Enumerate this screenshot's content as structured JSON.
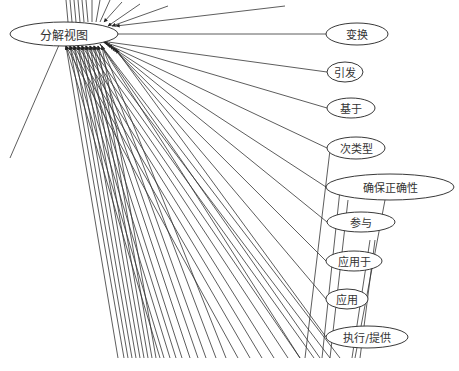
{
  "diagram": {
    "title": "",
    "hub": {
      "label": "分解视图",
      "cx": 64,
      "cy": 34,
      "rx": 54,
      "ry": 12
    },
    "nodes": [
      {
        "id": "bianhuan",
        "label": "变换",
        "cx": 357,
        "cy": 34,
        "rx": 31,
        "ry": 11
      },
      {
        "id": "yinfa",
        "label": "引发",
        "cx": 345,
        "cy": 72,
        "rx": 18,
        "ry": 10
      },
      {
        "id": "jiyu",
        "label": "基于",
        "cx": 351,
        "cy": 108,
        "rx": 24,
        "ry": 10
      },
      {
        "id": "cileixing",
        "label": "次类型",
        "cx": 356,
        "cy": 148,
        "rx": 29,
        "ry": 11
      },
      {
        "id": "quebao",
        "label": "确保正确性",
        "cx": 390,
        "cy": 187,
        "rx": 64,
        "ry": 13
      },
      {
        "id": "canyu",
        "label": "参与",
        "cx": 361,
        "cy": 222,
        "rx": 34,
        "ry": 10
      },
      {
        "id": "yingyongyu",
        "label": "应用于",
        "cx": 354,
        "cy": 261,
        "rx": 28,
        "ry": 10
      },
      {
        "id": "yingyong",
        "label": "应用",
        "cx": 347,
        "cy": 299,
        "rx": 21,
        "ry": 10
      },
      {
        "id": "zhixing",
        "label": "执行/提供",
        "cx": 367,
        "cy": 337,
        "rx": 41,
        "ry": 11
      }
    ],
    "colors": {
      "stroke": "#222222",
      "line": "#333333",
      "background": "#ffffff"
    }
  }
}
